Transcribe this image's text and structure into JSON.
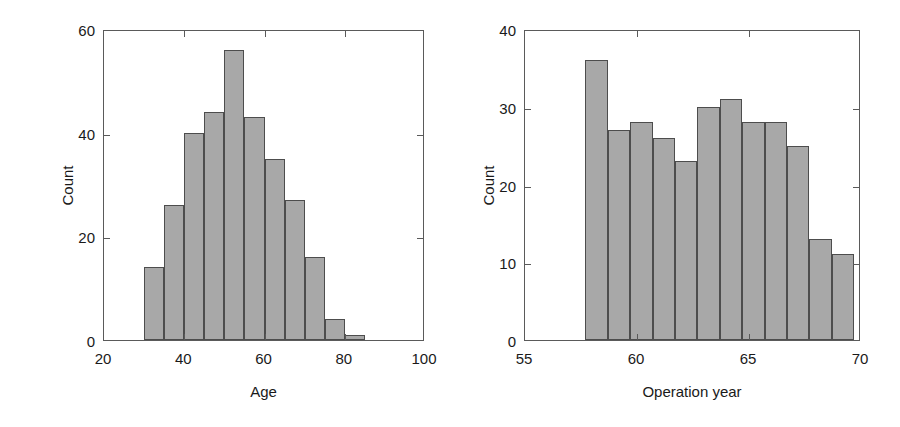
{
  "figure": {
    "background_color": "#ffffff",
    "bar_fill_color": "#a8a8a8",
    "bar_edge_color": "#4d4d4d",
    "axis_color": "#5a5a5a",
    "text_color": "#1a1a1a"
  },
  "panels": [
    {
      "id": "age-histogram",
      "chart_data": {
        "type": "bar",
        "title": "",
        "xlabel": "Age",
        "ylabel": "Count",
        "xlim": [
          20,
          100
        ],
        "ylim": [
          0,
          60
        ],
        "xticks": [
          "20",
          "40",
          "60",
          "80",
          "100"
        ],
        "xtick_values": [
          20,
          40,
          60,
          80,
          100
        ],
        "yticks": [
          "0",
          "20",
          "40",
          "60"
        ],
        "ytick_values": [
          0,
          20,
          40,
          60
        ],
        "grid": false,
        "legend": "none",
        "bin_width": 5,
        "bin_edges": [
          30,
          35,
          40,
          45,
          50,
          55,
          60,
          65,
          70,
          75,
          80,
          85
        ],
        "categories": [
          "30-35",
          "35-40",
          "40-45",
          "45-50",
          "50-55",
          "55-60",
          "60-65",
          "65-70",
          "70-75",
          "75-80",
          "80-85"
        ],
        "values": [
          14,
          26,
          40,
          44,
          56,
          43,
          35,
          27,
          16,
          4,
          1
        ]
      }
    },
    {
      "id": "operation-year-histogram",
      "chart_data": {
        "type": "bar",
        "title": "",
        "xlabel": "Operation year",
        "ylabel": "Count",
        "xlim": [
          55,
          70
        ],
        "ylim": [
          0,
          40
        ],
        "xticks": [
          "55",
          "60",
          "65",
          "70"
        ],
        "xtick_values": [
          55,
          60,
          65,
          70
        ],
        "yticks": [
          "0",
          "10",
          "20",
          "30",
          "40"
        ],
        "ytick_values": [
          0,
          10,
          20,
          30,
          40
        ],
        "grid": false,
        "legend": "none",
        "bin_width": 1,
        "bin_edges": [
          57.7,
          58.7,
          59.7,
          60.7,
          61.7,
          62.7,
          63.7,
          64.7,
          65.7,
          66.7,
          67.7,
          68.7,
          69.7
        ],
        "categories": [
          "58",
          "59",
          "60",
          "61",
          "62",
          "63",
          "64",
          "65",
          "66",
          "67",
          "68",
          "69"
        ],
        "values": [
          36,
          27,
          28,
          26,
          23,
          30,
          31,
          28,
          28,
          25,
          13,
          11
        ]
      }
    }
  ]
}
